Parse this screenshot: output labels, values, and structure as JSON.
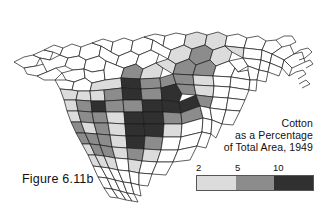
{
  "figure": {
    "label": "Figure 6.11b"
  },
  "title": {
    "line1": "Cotton",
    "line2": "as a Percentage",
    "line3": "of Total Area, 1949"
  },
  "legend": {
    "ticks": [
      "2",
      "5",
      "10"
    ],
    "swatch_colors": [
      "#dcdcdc",
      "#8c8c8c",
      "#303030"
    ],
    "class_labels": [
      "2 to 5",
      "5 to 10",
      "over 10"
    ],
    "lowest_class_color": "#ffffff"
  },
  "map": {
    "subject": "North Carolina and South Carolina counties",
    "outline_color": "#1a1a1a",
    "background_color": "#ffffff"
  },
  "chart_data": {
    "type": "choropleth-map",
    "title": "Cotton as a Percentage of Total Area, 1949",
    "legend_breaks": [
      2,
      5,
      10
    ],
    "class_colors": [
      "#ffffff",
      "#dcdcdc",
      "#8c8c8c",
      "#303030"
    ],
    "class_ranges": [
      "under 2",
      "2 to 5",
      "5 to 10",
      "over 10"
    ],
    "regions": [
      {
        "id": "nc-far-west-1",
        "class": 0,
        "pts": "14,62 24,57 33,55 40,58 36,66 24,68"
      },
      {
        "id": "nc-far-west-2",
        "class": 0,
        "pts": "24,68 36,66 44,64 47,72 37,76 27,74"
      },
      {
        "id": "nc-far-west-3",
        "class": 0,
        "pts": "33,55 44,50 53,52 50,60 40,58"
      },
      {
        "id": "nc-far-west-4",
        "class": 0,
        "pts": "44,50 54,45 63,48 60,55 53,52"
      },
      {
        "id": "nc-far-west-5",
        "class": 0,
        "pts": "50,60 60,55 68,58 65,66 56,68 47,72 40,58 50,60"
      },
      {
        "id": "nc-far-west-6",
        "class": 0,
        "pts": "37,76 47,72 56,68 62,73 55,80 44,80"
      },
      {
        "id": "nc-west-1",
        "class": 0,
        "pts": "63,48 72,44 81,47 79,56 68,58 60,55"
      },
      {
        "id": "nc-west-2",
        "class": 0,
        "pts": "68,58 79,56 86,60 84,69 73,70 65,66"
      },
      {
        "id": "nc-west-3",
        "class": 0,
        "pts": "62,73 73,70 84,69 85,78 74,82 66,80"
      },
      {
        "id": "nc-west-4",
        "class": 0,
        "pts": "55,80 66,80 74,82 72,90 60,89"
      },
      {
        "id": "nc-west-5",
        "class": 0,
        "pts": "81,47 92,43 101,46 99,56 86,60 79,56"
      },
      {
        "id": "nc-west-6",
        "class": 0,
        "pts": "86,60 99,56 106,61 104,70 92,72 84,69"
      },
      {
        "id": "nc-west-7",
        "class": 0,
        "pts": "84,69 92,72 104,70 105,80 92,83 85,78"
      },
      {
        "id": "nc-west-8",
        "class": 0,
        "pts": "74,82 85,78 92,83 90,91 78,91 72,90"
      },
      {
        "id": "nc-pied-1",
        "class": 0,
        "pts": "92,43 103,39 113,42 111,52 101,46"
      },
      {
        "id": "nc-pied-2",
        "class": 0,
        "pts": "101,46 111,52 119,56 116,65 106,61 99,56"
      },
      {
        "id": "nc-pied-3",
        "class": 0,
        "pts": "106,61 116,65 124,68 121,78 105,80 104,70"
      },
      {
        "id": "nc-pied-4",
        "class": 1,
        "pts": "105,80 121,78 122,88 104,90 90,91 92,83"
      },
      {
        "id": "nc-pied-5",
        "class": 0,
        "pts": "113,42 124,38 133,41 131,51 119,56 111,52"
      },
      {
        "id": "nc-pied-6",
        "class": 0,
        "pts": "119,56 131,51 139,55 136,64 124,68 116,65"
      },
      {
        "id": "nc-pied-7",
        "class": 2,
        "pts": "124,68 136,64 143,69 140,79 121,78"
      },
      {
        "id": "nc-pied-8",
        "class": 3,
        "pts": "121,78 140,79 141,89 122,88"
      },
      {
        "id": "nc-pied-9",
        "class": 0,
        "pts": "133,41 144,37 153,40 151,50 139,55 131,51"
      },
      {
        "id": "nc-pied-10",
        "class": 0,
        "pts": "139,55 151,50 159,54 156,63 143,69 136,64"
      },
      {
        "id": "nc-pied-11",
        "class": 1,
        "pts": "143,69 156,63 163,68 160,78 140,79"
      },
      {
        "id": "nc-pied-12",
        "class": 2,
        "pts": "140,79 160,78 161,88 141,89"
      },
      {
        "id": "nc-pied-13",
        "class": 0,
        "pts": "144,37 155,34 165,36 163,46 153,40"
      },
      {
        "id": "nc-pied-14",
        "class": 0,
        "pts": "153,40 163,46 171,50 168,59 159,54 151,50"
      },
      {
        "id": "nc-pied-15",
        "class": 1,
        "pts": "156,63 168,59 176,64 173,74 163,68"
      },
      {
        "id": "nc-pied-16",
        "class": 2,
        "pts": "160,78 173,74 176,84 161,88"
      },
      {
        "id": "nc-pied-17",
        "class": 0,
        "pts": "165,36 176,33 186,35 184,45 171,50 163,46"
      },
      {
        "id": "nc-coastal-1",
        "class": 1,
        "pts": "171,50 184,45 192,49 189,59 176,64 168,59"
      },
      {
        "id": "nc-coastal-2",
        "class": 2,
        "pts": "176,64 189,59 196,65 193,75 173,74"
      },
      {
        "id": "nc-coastal-3",
        "class": 2,
        "pts": "173,74 193,75 194,85 176,84"
      },
      {
        "id": "nc-coastal-4",
        "class": 1,
        "pts": "186,35 197,32 207,35 205,45 192,49 184,45"
      },
      {
        "id": "nc-coastal-5",
        "class": 2,
        "pts": "192,49 205,45 213,50 210,60 196,65 189,59"
      },
      {
        "id": "nc-coastal-6",
        "class": 2,
        "pts": "196,65 210,60 216,66 213,76 193,75"
      },
      {
        "id": "nc-coastal-7",
        "class": 1,
        "pts": "193,75 213,76 214,86 194,85"
      },
      {
        "id": "nc-coastal-8",
        "class": 1,
        "pts": "207,35 218,32 227,36 225,46 213,50 205,45"
      },
      {
        "id": "nc-coastal-9",
        "class": 1,
        "pts": "213,50 225,46 232,52 229,61 216,66 210,60"
      },
      {
        "id": "nc-coastal-10",
        "class": 0,
        "pts": "216,66 229,61 235,68 231,77 213,76"
      },
      {
        "id": "nc-coastal-11",
        "class": 0,
        "pts": "213,76 231,77 230,87 214,86"
      },
      {
        "id": "nc-coastal-12",
        "class": 0,
        "pts": "227,36 238,34 247,38 244,48 225,46"
      },
      {
        "id": "nc-coastal-13",
        "class": 1,
        "pts": "225,46 244,48 243,58 232,52"
      },
      {
        "id": "nc-coastal-14",
        "class": 0,
        "pts": "229,61 243,58 248,66 238,72 235,68"
      },
      {
        "id": "nc-coastal-15",
        "class": 0,
        "pts": "235,68 238,72 248,70 250,80 231,77"
      },
      {
        "id": "nc-coastal-16",
        "class": 0,
        "pts": "231,77 250,80 249,90 230,87"
      },
      {
        "id": "nc-coastal-17",
        "class": 0,
        "pts": "247,38 258,36 266,41 262,50 244,48"
      },
      {
        "id": "nc-coastal-18",
        "class": 0,
        "pts": "244,48 262,50 261,60 243,58"
      },
      {
        "id": "nc-coastal-19",
        "class": 0,
        "pts": "243,58 261,60 259,70 248,66"
      },
      {
        "id": "nc-coastal-20",
        "class": 0,
        "pts": "248,66 259,70 257,80 250,80 248,70"
      },
      {
        "id": "nc-coastal-21",
        "class": 0,
        "pts": "250,80 257,80 256,91 249,90"
      },
      {
        "id": "nc-coastal-22",
        "class": 0,
        "pts": "266,41 276,40 282,47 272,54 262,50"
      },
      {
        "id": "nc-coastal-23",
        "class": 0,
        "pts": "262,50 272,54 270,63 261,60"
      },
      {
        "id": "nc-coastal-24",
        "class": 0,
        "pts": "261,60 270,63 268,72 259,70"
      },
      {
        "id": "nc-coastal-25",
        "class": 0,
        "pts": "259,70 268,72 266,82 257,80"
      },
      {
        "id": "nc-coastal-26",
        "class": 0,
        "pts": "282,47 290,45 294,54 284,60 272,54"
      },
      {
        "id": "nc-coastal-27",
        "class": 0,
        "pts": "272,54 284,60 282,68 270,63"
      },
      {
        "id": "nc-coastal-28",
        "class": 0,
        "pts": "270,63 282,68 279,76 268,72"
      },
      {
        "id": "nc-coastal-29",
        "class": 0,
        "pts": "294,54 302,52 305,62 292,68 284,60"
      },
      {
        "id": "nc-coastal-30",
        "class": 0,
        "pts": "284,60 292,68 289,76 282,68"
      },
      {
        "id": "sc-up-1",
        "class": 1,
        "pts": "60,89 72,90 78,91 76,100 64,100"
      },
      {
        "id": "sc-up-2",
        "class": 1,
        "pts": "78,91 90,91 91,101 76,100"
      },
      {
        "id": "sc-up-3",
        "class": 1,
        "pts": "90,91 104,90 105,101 91,101"
      },
      {
        "id": "sc-up-4",
        "class": 2,
        "pts": "104,90 122,88 123,100 105,101"
      },
      {
        "id": "sc-up-5",
        "class": 3,
        "pts": "122,88 141,89 142,100 123,100"
      },
      {
        "id": "sc-up-6",
        "class": 2,
        "pts": "141,89 161,88 162,100 142,100"
      },
      {
        "id": "sc-up-7",
        "class": 3,
        "pts": "161,88 176,84 182,94 179,102 162,100"
      },
      {
        "id": "sc-up-8",
        "class": 2,
        "pts": "176,84 194,85 196,95 182,94"
      },
      {
        "id": "sc-up-9",
        "class": 1,
        "pts": "194,85 214,86 213,97 196,95"
      },
      {
        "id": "sc-up-10",
        "class": 0,
        "pts": "214,86 230,87 228,98 213,97"
      },
      {
        "id": "sc-up-11",
        "class": 0,
        "pts": "230,87 249,90 245,100 228,98"
      },
      {
        "id": "sc-mid-1",
        "class": 1,
        "pts": "64,100 76,100 78,111 67,111"
      },
      {
        "id": "sc-mid-2",
        "class": 2,
        "pts": "76,100 91,101 92,112 78,111"
      },
      {
        "id": "sc-mid-3",
        "class": 3,
        "pts": "91,101 105,101 106,112 92,112"
      },
      {
        "id": "sc-mid-4",
        "class": 2,
        "pts": "105,101 123,100 124,112 106,112"
      },
      {
        "id": "sc-mid-5",
        "class": 2,
        "pts": "123,100 142,100 143,112 124,112"
      },
      {
        "id": "sc-mid-6",
        "class": 3,
        "pts": "142,100 162,100 163,112 143,112"
      },
      {
        "id": "sc-mid-7",
        "class": 3,
        "pts": "162,100 179,102 181,113 163,112"
      },
      {
        "id": "sc-mid-8",
        "class": 3,
        "pts": "179,102 196,95 200,106 181,113"
      },
      {
        "id": "sc-mid-9",
        "class": 2,
        "pts": "196,95 213,97 210,108 200,106"
      },
      {
        "id": "sc-mid-10",
        "class": 0,
        "pts": "213,97 228,98 226,110 210,108"
      },
      {
        "id": "sc-mid-11",
        "class": 0,
        "pts": "228,98 245,100 240,111 226,110"
      },
      {
        "id": "sc-low-1",
        "class": 1,
        "pts": "67,111 78,111 81,122 71,122"
      },
      {
        "id": "sc-low-2",
        "class": 2,
        "pts": "78,111 92,112 94,123 81,122"
      },
      {
        "id": "sc-low-3",
        "class": 2,
        "pts": "92,112 106,112 108,123 94,123"
      },
      {
        "id": "sc-low-4",
        "class": 1,
        "pts": "106,112 124,112 125,124 108,123"
      },
      {
        "id": "sc-low-5",
        "class": 3,
        "pts": "124,112 143,112 144,124 125,124"
      },
      {
        "id": "sc-low-6",
        "class": 3,
        "pts": "143,112 163,112 164,124 144,124"
      },
      {
        "id": "sc-low-7",
        "class": 2,
        "pts": "163,112 181,113 182,124 164,124"
      },
      {
        "id": "sc-low-8",
        "class": 2,
        "pts": "181,113 200,106 203,118 182,124"
      },
      {
        "id": "sc-low-9",
        "class": 0,
        "pts": "200,106 210,108 212,120 203,118"
      },
      {
        "id": "sc-low-10",
        "class": 0,
        "pts": "210,108 226,110 222,124 212,120"
      },
      {
        "id": "sc-low-11",
        "class": 0,
        "pts": "226,110 240,111 233,125 222,124"
      },
      {
        "id": "sc-low-12",
        "class": 2,
        "pts": "71,122 81,122 85,133 76,133"
      },
      {
        "id": "sc-low-13",
        "class": 1,
        "pts": "81,122 94,123 97,134 85,133"
      },
      {
        "id": "sc-low-14",
        "class": 2,
        "pts": "94,123 108,123 110,135 97,134"
      },
      {
        "id": "sc-low-15",
        "class": 1,
        "pts": "108,123 125,124 126,136 110,135"
      },
      {
        "id": "sc-low-16",
        "class": 3,
        "pts": "125,124 144,124 145,136 126,136"
      },
      {
        "id": "sc-low-17",
        "class": 3,
        "pts": "144,124 164,124 163,137 145,136"
      },
      {
        "id": "sc-low-18",
        "class": 1,
        "pts": "164,124 182,124 181,137 163,137"
      },
      {
        "id": "sc-low-19",
        "class": 0,
        "pts": "182,124 203,118 202,132 181,137"
      },
      {
        "id": "sc-low-20",
        "class": 0,
        "pts": "203,118 212,120 211,134 202,132"
      },
      {
        "id": "sc-low-21",
        "class": 0,
        "pts": "212,120 222,124 216,138 211,134"
      },
      {
        "id": "sc-low-22",
        "class": 2,
        "pts": "76,133 85,133 90,144 82,144"
      },
      {
        "id": "sc-low-23",
        "class": 2,
        "pts": "85,133 97,134 100,145 90,144"
      },
      {
        "id": "sc-low-24",
        "class": 2,
        "pts": "97,134 110,135 112,147 100,145"
      },
      {
        "id": "sc-low-25",
        "class": 1,
        "pts": "110,135 126,136 127,148 112,147"
      },
      {
        "id": "sc-low-26",
        "class": 3,
        "pts": "126,136 145,136 144,149 127,148"
      },
      {
        "id": "sc-low-27",
        "class": 2,
        "pts": "145,136 163,137 161,150 144,149"
      },
      {
        "id": "sc-low-28",
        "class": 0,
        "pts": "163,137 181,137 178,150 161,150"
      },
      {
        "id": "sc-low-29",
        "class": 0,
        "pts": "181,137 202,132 197,146 178,150"
      },
      {
        "id": "sc-low-30",
        "class": 0,
        "pts": "202,132 211,134 206,148 197,146"
      },
      {
        "id": "sc-coast-1",
        "class": 1,
        "pts": "82,144 90,144 95,155 88,155"
      },
      {
        "id": "sc-coast-2",
        "class": 2,
        "pts": "90,144 100,145 104,156 95,155"
      },
      {
        "id": "sc-coast-3",
        "class": 2,
        "pts": "100,145 112,147 115,158 104,156"
      },
      {
        "id": "sc-coast-4",
        "class": 1,
        "pts": "112,147 127,148 128,159 115,158"
      },
      {
        "id": "sc-coast-5",
        "class": 2,
        "pts": "127,148 144,149 142,161 128,159"
      },
      {
        "id": "sc-coast-6",
        "class": 1,
        "pts": "144,149 161,150 157,162 142,161"
      },
      {
        "id": "sc-coast-7",
        "class": 0,
        "pts": "161,150 178,150 173,162 157,162"
      },
      {
        "id": "sc-coast-8",
        "class": 0,
        "pts": "178,150 197,146 190,160 173,162"
      },
      {
        "id": "sc-coast-9",
        "class": 1,
        "pts": "88,155 95,155 101,167 93,166"
      },
      {
        "id": "sc-coast-10",
        "class": 1,
        "pts": "95,155 104,156 109,168 101,167"
      },
      {
        "id": "sc-coast-11",
        "class": 1,
        "pts": "104,156 115,158 118,170 109,168"
      },
      {
        "id": "sc-coast-12",
        "class": 0,
        "pts": "115,158 128,159 129,171 118,170"
      },
      {
        "id": "sc-coast-13",
        "class": 1,
        "pts": "128,159 142,161 139,173 129,171"
      },
      {
        "id": "sc-coast-14",
        "class": 0,
        "pts": "142,161 157,162 152,174 139,173"
      },
      {
        "id": "sc-coast-15",
        "class": 0,
        "pts": "157,162 173,162 166,175 152,174"
      },
      {
        "id": "sc-coast-16",
        "class": 0,
        "pts": "93,166 101,167 107,178 98,177"
      },
      {
        "id": "sc-coast-17",
        "class": 0,
        "pts": "101,167 109,168 115,180 107,178"
      },
      {
        "id": "sc-coast-18",
        "class": 0,
        "pts": "109,168 118,170 123,182 115,180"
      },
      {
        "id": "sc-coast-19",
        "class": 0,
        "pts": "118,170 129,171 131,183 123,182"
      },
      {
        "id": "sc-coast-20",
        "class": 0,
        "pts": "129,171 139,173 139,185 131,183"
      },
      {
        "id": "sc-coast-21",
        "class": 0,
        "pts": "139,173 152,174 148,186 139,185"
      },
      {
        "id": "sc-coast-22",
        "class": 0,
        "pts": "98,177 107,178 112,189 104,188"
      },
      {
        "id": "sc-coast-23",
        "class": 0,
        "pts": "107,178 115,180 120,191 112,189"
      },
      {
        "id": "sc-coast-24",
        "class": 0,
        "pts": "115,180 123,182 127,193 120,191"
      },
      {
        "id": "sc-coast-25",
        "class": 0,
        "pts": "123,182 131,183 134,194 127,193"
      },
      {
        "id": "sc-coast-26",
        "class": 0,
        "pts": "131,183 139,185 141,196 134,194"
      },
      {
        "id": "sc-coast-27",
        "class": 0,
        "pts": "104,188 112,189 118,198 110,197"
      },
      {
        "id": "sc-coast-28",
        "class": 0,
        "pts": "112,189 120,191 126,200 118,198"
      },
      {
        "id": "sc-coast-29",
        "class": 0,
        "pts": "120,191 127,193 132,201 126,200"
      },
      {
        "id": "sc-coast-30",
        "class": 0,
        "pts": "127,193 134,194 138,202 132,201"
      }
    ],
    "coast_lines": [
      "M 294,54 L 300,50 L 308,48 L 312,52 L 305,58 L 299,60",
      "M 289,76 L 296,72 L 303,70 L 306,74 L 298,79",
      "M 276,40 L 284,36 L 292,36 L 296,42 L 290,45",
      "M 305,62 L 310,60 L 313,64 L 306,68",
      "M 299,84 L 306,80 L 310,84 L 302,88"
    ]
  }
}
